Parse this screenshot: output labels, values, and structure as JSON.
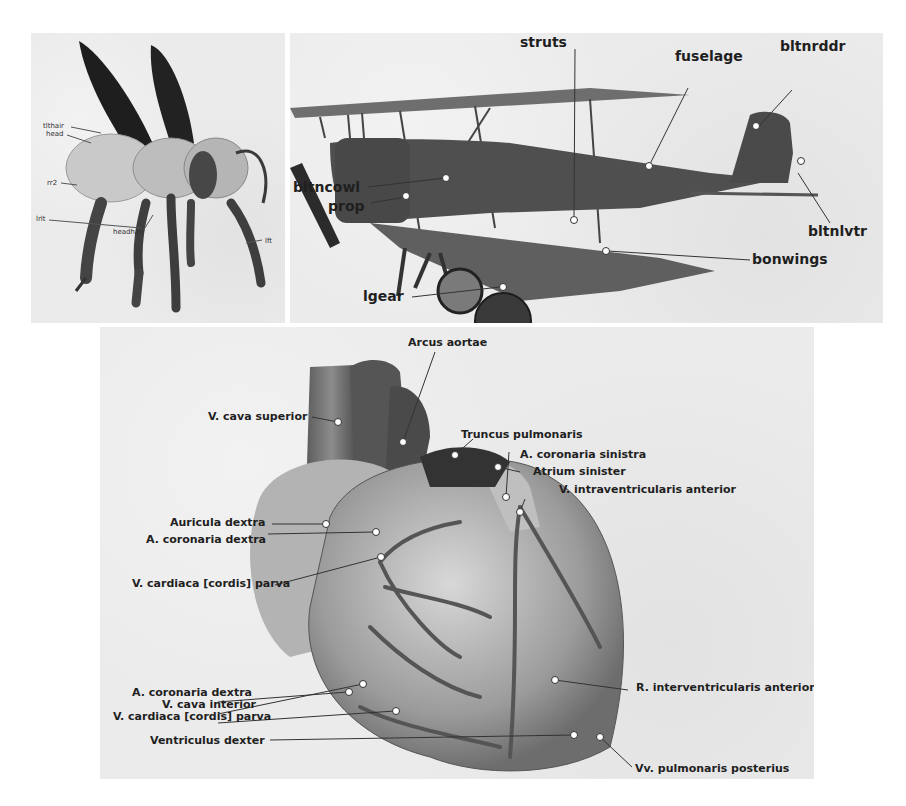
{
  "figure": {
    "panels": [
      {
        "id": "bee",
        "subject": "Honey bee 3D model",
        "labels": [
          {
            "text": "tlthair"
          },
          {
            "text": "head"
          },
          {
            "text": "rr2"
          },
          {
            "text": "lrlt"
          },
          {
            "text": "headhair"
          },
          {
            "text": "lft"
          }
        ]
      },
      {
        "id": "biplane",
        "subject": "Biplane 3D model",
        "labels": [
          {
            "text": "struts"
          },
          {
            "text": "fuselage"
          },
          {
            "text": "bltnrddr"
          },
          {
            "text": "bltncowl"
          },
          {
            "text": "prop"
          },
          {
            "text": "bltnlvtr"
          },
          {
            "text": "bonwings"
          },
          {
            "text": "lgear"
          }
        ]
      },
      {
        "id": "heart",
        "subject": "Human heart 3D model",
        "labels": [
          {
            "text": "Arcus aortae"
          },
          {
            "text": "V. cava superior"
          },
          {
            "text": "Truncus pulmonaris"
          },
          {
            "text": "A. coronaria sinistra"
          },
          {
            "text": "Atrium sinister"
          },
          {
            "text": "V. intraventricularis anterior"
          },
          {
            "text": "Auricula dextra"
          },
          {
            "text": "A. coronaria dextra"
          },
          {
            "text": "V. cardiaca [cordis] parva"
          },
          {
            "text": "A. coronaria dextra"
          },
          {
            "text": "V. cava interior"
          },
          {
            "text": "V. cardiaca [cordis] parva"
          },
          {
            "text": "R. interventricularis anterior"
          },
          {
            "text": "Ventriculus dexter"
          },
          {
            "text": "Vv. pulmonaris posterius"
          }
        ]
      }
    ]
  }
}
